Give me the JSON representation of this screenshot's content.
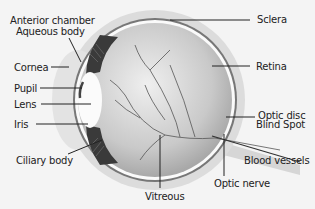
{
  "diagram": {
    "labels": {
      "anterior_chamber": "Anterior chamber",
      "aqueous_body": "Aqueous body",
      "cornea": "Cornea",
      "pupil": "Pupil",
      "lens": "Lens",
      "iris": "Iris",
      "ciliary_body": "Ciliary body",
      "vitreous": "Vitreous",
      "sclera": "Sclera",
      "retina": "Retina",
      "optic_disc": "Optic disc",
      "blind_spot": "Blind Spot",
      "blood_vessels": "Blood vessels",
      "optic_nerve": "Optic nerve"
    },
    "colors": {
      "background": "#f4f4f4",
      "sclera": "#d9d9d9",
      "eyeball": "#c8c8c8",
      "dark_tissue": "#3a3a3a",
      "leader_lines": "#222222"
    }
  }
}
